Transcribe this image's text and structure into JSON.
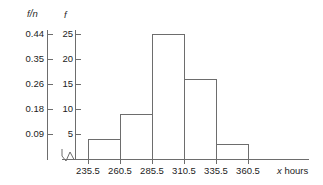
{
  "chart_data": {
    "type": "bar",
    "title": "",
    "subtitle": "",
    "xlabel": "x  hours",
    "xlabel_variable": "x",
    "xlabel_units": "hours",
    "ylabel_primary": "f",
    "ylabel_secondary": "f/n",
    "ylabel_secondary_numerator": "f",
    "ylabel_secondary_slash": "/",
    "ylabel_secondary_denominator": "n",
    "grid": false,
    "legend": false,
    "legend_position": "none",
    "axis_break_x": true,
    "bin_edges": [
      235.5,
      260.5,
      285.5,
      310.5,
      335.5,
      360.5
    ],
    "bin_width": 25,
    "categories": [
      "235.5-260.5",
      "260.5-285.5",
      "285.5-310.5",
      "310.5-335.5",
      "335.5-360.5"
    ],
    "values": [
      4,
      9,
      25,
      16,
      3
    ],
    "values_relative": [
      0.07,
      0.16,
      0.44,
      0.28,
      0.05
    ],
    "ylim": [
      0,
      26
    ],
    "ylim_secondary": [
      0,
      0.46
    ],
    "yticks_primary": [
      5,
      10,
      15,
      20,
      25
    ],
    "yticks_secondary": [
      0.09,
      0.18,
      0.26,
      0.35,
      0.44
    ],
    "xticks": [
      "235.5",
      "260.5",
      "285.5",
      "310.5",
      "335.5",
      "360.5"
    ],
    "total_n": 57,
    "series": [
      {
        "name": "f",
        "values": [
          4,
          9,
          25,
          16,
          3
        ]
      }
    ]
  },
  "colors": {
    "bar_stroke": "#6d6d6d",
    "bar_fill": "none",
    "axis": "#6d6d6d",
    "text": "#1c1c1c",
    "background": "#ffffff"
  }
}
